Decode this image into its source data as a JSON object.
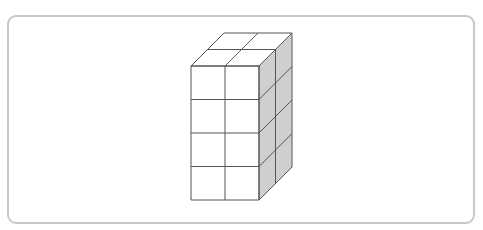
{
  "figure": {
    "columns_wide": 2,
    "rows_tall": 4,
    "columns_deep": 2,
    "total_cubes": 16,
    "colors": {
      "frame_border": "#c8c8c8",
      "front_face": "#ffffff",
      "top_face": "#ffffff",
      "side_face": "#cfcfcf",
      "edge": "#555555"
    }
  }
}
